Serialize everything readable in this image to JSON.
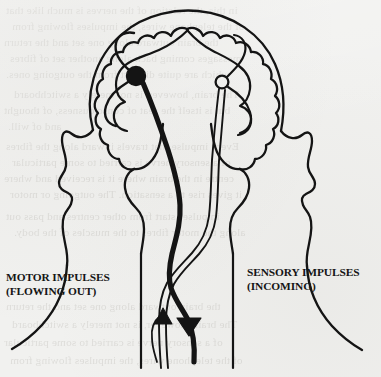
{
  "figure": {
    "kind": "anatomical-line-drawing",
    "width": 381,
    "height": 377,
    "background_color": "#f1f1ef",
    "ink_color": "#141414"
  },
  "labels": {
    "motor": {
      "line1": "MOTOR IMPULSES",
      "line2": "(FLOWING OUT)"
    },
    "sensory": {
      "line1": "SENSORY IMPULSES",
      "line2": "(INCOMING)"
    }
  },
  "parts": {
    "skull_outline": "skull-outline",
    "brain_cortex": "brain-cortex-gyri",
    "left_ear": "left-ear-outline",
    "right_ear": "right-ear-outline",
    "left_shoulder": "left-shoulder-curve",
    "right_shoulder": "right-shoulder-curve",
    "brainstem": "brainstem-outline",
    "spinal_cord": "spinal-cord-outline",
    "motor_neuron_body": "motor-neuron-cell-body",
    "sensory_neuron_body": "sensory-neuron-cell-body",
    "motor_fiber": "motor-nerve-fiber",
    "sensory_fiber": "sensory-nerve-fiber",
    "decussation": "nerve-fiber-crossing",
    "motor_arrow": "motor-arrowhead-down",
    "sensory_arrow": "sensory-arrowhead-up"
  },
  "ghost_text": {
    "note": "faint illegible show-through text from the reverse side of the scanned page",
    "lines": [
      "in this, the relation of the nerves is much like that",
      "of the telephone wires, the impulses flowing from",
      "the brain outward along one set and the return",
      "messages coming back along another set of fibres",
      "which are quite distinct from the outgoing ones.",
      "The brain, however, is not merely a switchboard",
      "but is itself the seat of consciousness, of thought",
      "and of will.",
      "Every impulse that travels inward along the fibres",
      "of a sensory nerve is carried to some particular",
      "centre in the brain where it is received and where",
      "it gives rise to a sensation. The outgoing or motor",
      "impulses start from other centres and pass out",
      "along the motor fibres to the muscles of the body."
    ]
  }
}
